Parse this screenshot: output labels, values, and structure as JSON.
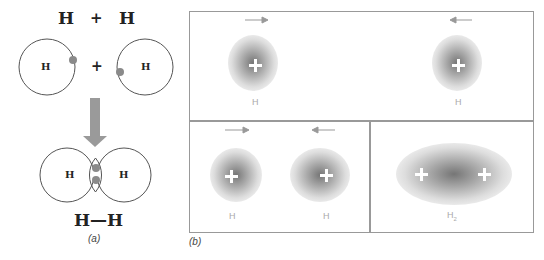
{
  "panel_a": {
    "reactant_left": "H",
    "reactant_plus": "+",
    "reactant_right": "H",
    "atom_left_label": "H",
    "atom_middle_plus": "+",
    "atom_right_label": "H",
    "molecule_left_label": "H",
    "molecule_right_label": "H",
    "formula": "H—H",
    "caption": "(a)"
  },
  "panel_b": {
    "caption": "(b)",
    "top": {
      "left_atom_label": "H",
      "right_atom_label": "H"
    },
    "bottom_left": {
      "left_atom_label": "H",
      "right_atom_label": "H"
    },
    "bottom_right": {
      "molecule_label_main": "H",
      "molecule_label_sub": "2"
    }
  },
  "colors": {
    "electron": "#8a8a8a",
    "arrow": "#999999",
    "outline": "#555555",
    "panel_border": "#999999"
  }
}
